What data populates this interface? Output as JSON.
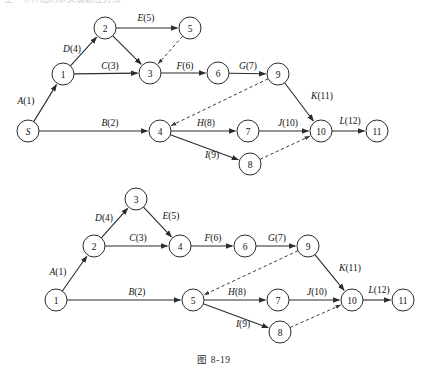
{
  "figure": {
    "caption": "图 8-19",
    "cut_text": "上一节介绍的求关键路径方法",
    "background": "#ffffff",
    "ink": "#2b2b2b"
  },
  "diagrams": [
    {
      "id": "top",
      "name": "aoe-network-top",
      "nodes": [
        {
          "id": "S",
          "label": "S",
          "x": 28,
          "y": 131,
          "italic": true
        },
        {
          "id": "1",
          "label": "1",
          "x": 63,
          "y": 74,
          "italic": false
        },
        {
          "id": "2",
          "label": "2",
          "x": 105,
          "y": 28,
          "italic": false
        },
        {
          "id": "5",
          "label": "5",
          "x": 190,
          "y": 28,
          "italic": false
        },
        {
          "id": "3",
          "label": "3",
          "x": 150,
          "y": 73,
          "italic": false
        },
        {
          "id": "6",
          "label": "6",
          "x": 218,
          "y": 73,
          "italic": false
        },
        {
          "id": "9",
          "label": "9",
          "x": 278,
          "y": 74,
          "italic": false
        },
        {
          "id": "4",
          "label": "4",
          "x": 160,
          "y": 131,
          "italic": false
        },
        {
          "id": "7",
          "label": "7",
          "x": 248,
          "y": 131,
          "italic": false
        },
        {
          "id": "8",
          "label": "8",
          "x": 250,
          "y": 164,
          "italic": false
        },
        {
          "id": "10",
          "label": "10",
          "x": 321,
          "y": 131,
          "italic": false
        },
        {
          "id": "11",
          "label": "11",
          "x": 377,
          "y": 131,
          "italic": false
        }
      ],
      "edges": [
        {
          "from": "S",
          "to": "1",
          "activity": "A",
          "weight": 1,
          "label": "A(1)",
          "lx": 26,
          "ly": 104,
          "dashed": false
        },
        {
          "from": "1",
          "to": "2",
          "activity": "D",
          "weight": 4,
          "label": "D(4)",
          "lx": 72,
          "ly": 52,
          "dashed": false
        },
        {
          "from": "2",
          "to": "5",
          "activity": "E",
          "weight": 5,
          "label": "E(5)",
          "lx": 146,
          "ly": 21,
          "dashed": false
        },
        {
          "from": "1",
          "to": "3",
          "activity": "C",
          "weight": 3,
          "label": "C(3)",
          "lx": 110,
          "ly": 69,
          "dashed": false
        },
        {
          "from": "2",
          "to": "3",
          "activity": "",
          "weight": null,
          "label": "",
          "lx": 0,
          "ly": 0,
          "dashed": false
        },
        {
          "from": "5",
          "to": "3",
          "activity": "",
          "weight": null,
          "label": "",
          "lx": 0,
          "ly": 0,
          "dashed": true
        },
        {
          "from": "3",
          "to": "6",
          "activity": "F",
          "weight": 6,
          "label": "F(6)",
          "lx": 185,
          "ly": 69,
          "dashed": false
        },
        {
          "from": "6",
          "to": "9",
          "activity": "G",
          "weight": 7,
          "label": "G(7)",
          "lx": 248,
          "ly": 69,
          "dashed": false
        },
        {
          "from": "S",
          "to": "4",
          "activity": "B",
          "weight": 2,
          "label": "B(2)",
          "lx": 110,
          "ly": 126,
          "dashed": false
        },
        {
          "from": "9",
          "to": "4",
          "activity": "",
          "weight": null,
          "label": "",
          "lx": 0,
          "ly": 0,
          "dashed": true
        },
        {
          "from": "4",
          "to": "7",
          "activity": "H",
          "weight": 8,
          "label": "H(8)",
          "lx": 206,
          "ly": 126,
          "dashed": false
        },
        {
          "from": "7",
          "to": "10",
          "activity": "J",
          "weight": 10,
          "label": "J(10)",
          "lx": 288,
          "ly": 126,
          "dashed": false
        },
        {
          "from": "4",
          "to": "8",
          "activity": "I",
          "weight": 9,
          "label": "I(9)",
          "lx": 212,
          "ly": 158,
          "dashed": false
        },
        {
          "from": "8",
          "to": "10",
          "activity": "",
          "weight": null,
          "label": "",
          "lx": 0,
          "ly": 0,
          "dashed": true
        },
        {
          "from": "9",
          "to": "10",
          "activity": "K",
          "weight": 11,
          "label": "K(11)",
          "lx": 322,
          "ly": 99,
          "dashed": false
        },
        {
          "from": "10",
          "to": "11",
          "activity": "L",
          "weight": 12,
          "label": "L(12)",
          "lx": 350,
          "ly": 124,
          "dashed": false
        }
      ]
    },
    {
      "id": "bottom",
      "name": "aoe-network-bottom",
      "nodes": [
        {
          "id": "1",
          "label": "1",
          "x": 56,
          "y": 300,
          "italic": false
        },
        {
          "id": "2",
          "label": "2",
          "x": 94,
          "y": 246,
          "italic": false
        },
        {
          "id": "3",
          "label": "3",
          "x": 136,
          "y": 199,
          "italic": false
        },
        {
          "id": "4",
          "label": "4",
          "x": 180,
          "y": 246,
          "italic": false
        },
        {
          "id": "6",
          "label": "6",
          "x": 245,
          "y": 246,
          "italic": false
        },
        {
          "id": "9",
          "label": "9",
          "x": 308,
          "y": 246,
          "italic": false
        },
        {
          "id": "5",
          "label": "5",
          "x": 193,
          "y": 300,
          "italic": false
        },
        {
          "id": "7",
          "label": "7",
          "x": 278,
          "y": 300,
          "italic": false
        },
        {
          "id": "8",
          "label": "8",
          "x": 280,
          "y": 332,
          "italic": false
        },
        {
          "id": "10",
          "label": "10",
          "x": 352,
          "y": 300,
          "italic": false
        },
        {
          "id": "11",
          "label": "11",
          "x": 403,
          "y": 300,
          "italic": false
        }
      ],
      "edges": [
        {
          "from": "1",
          "to": "2",
          "activity": "A",
          "weight": 1,
          "label": "A(1)",
          "lx": 58,
          "ly": 275,
          "dashed": false
        },
        {
          "from": "2",
          "to": "3",
          "activity": "D",
          "weight": 4,
          "label": "D(4)",
          "lx": 104,
          "ly": 221,
          "dashed": false
        },
        {
          "from": "3",
          "to": "4",
          "activity": "E",
          "weight": 5,
          "label": "E(5)",
          "lx": 171,
          "ly": 219,
          "dashed": false
        },
        {
          "from": "2",
          "to": "4",
          "activity": "C",
          "weight": 3,
          "label": "C(3)",
          "lx": 138,
          "ly": 241,
          "dashed": false
        },
        {
          "from": "4",
          "to": "6",
          "activity": "F",
          "weight": 6,
          "label": "F(6)",
          "lx": 213,
          "ly": 241,
          "dashed": false
        },
        {
          "from": "6",
          "to": "9",
          "activity": "G",
          "weight": 7,
          "label": "G(7)",
          "lx": 277,
          "ly": 241,
          "dashed": false
        },
        {
          "from": "1",
          "to": "5",
          "activity": "B",
          "weight": 2,
          "label": "B(2)",
          "lx": 137,
          "ly": 295,
          "dashed": false
        },
        {
          "from": "9",
          "to": "5",
          "activity": "",
          "weight": null,
          "label": "",
          "lx": 0,
          "ly": 0,
          "dashed": true
        },
        {
          "from": "5",
          "to": "7",
          "activity": "H",
          "weight": 8,
          "label": "H(8)",
          "lx": 237,
          "ly": 295,
          "dashed": false
        },
        {
          "from": "7",
          "to": "10",
          "activity": "J",
          "weight": 10,
          "label": "J(10)",
          "lx": 317,
          "ly": 295,
          "dashed": false
        },
        {
          "from": "5",
          "to": "8",
          "activity": "I",
          "weight": 9,
          "label": "I(9)",
          "lx": 243,
          "ly": 327,
          "dashed": false
        },
        {
          "from": "8",
          "to": "10",
          "activity": "",
          "weight": null,
          "label": "",
          "lx": 0,
          "ly": 0,
          "dashed": true
        },
        {
          "from": "9",
          "to": "10",
          "activity": "K",
          "weight": 11,
          "label": "K(11)",
          "lx": 350,
          "ly": 271,
          "dashed": false
        },
        {
          "from": "10",
          "to": "11",
          "activity": "L",
          "weight": 12,
          "label": "L(12)",
          "lx": 379,
          "ly": 293,
          "dashed": false
        }
      ]
    }
  ]
}
